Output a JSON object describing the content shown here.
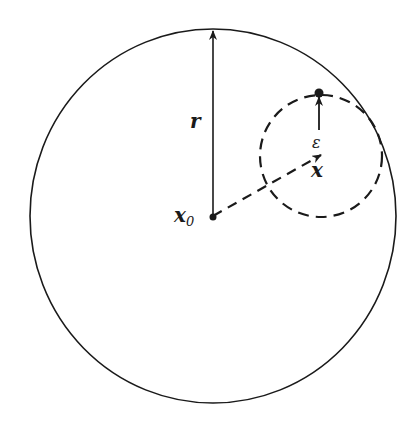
{
  "diagram": {
    "type": "geometric-figure",
    "labels": {
      "radius": "r",
      "center_big": "x",
      "center_big_subscript": "0",
      "center_small": "x",
      "epsilon": "ε"
    },
    "colors": {
      "stroke": "#1a1a1a",
      "background": "#ffffff"
    },
    "elements": {
      "outer_circle": {
        "cx": 213,
        "cy": 216,
        "rx": 183,
        "ry": 187,
        "style": "solid"
      },
      "inner_circle": {
        "cx": 321,
        "cy": 156,
        "r": 61,
        "style": "dashed"
      },
      "radius_arrow": {
        "from": [
          213,
          216
        ],
        "to": [
          213,
          30
        ]
      },
      "center_vector": {
        "from": [
          213,
          216
        ],
        "to": [
          322,
          154
        ],
        "style": "dashed"
      },
      "epsilon_arrow": {
        "from": [
          319,
          152
        ],
        "to": [
          319,
          95
        ]
      },
      "points": [
        {
          "name": "x0",
          "x": 213,
          "y": 216
        },
        {
          "name": "boundary-point",
          "x": 319,
          "y": 93
        }
      ]
    }
  }
}
